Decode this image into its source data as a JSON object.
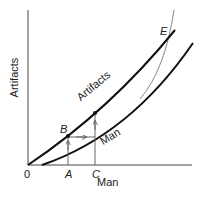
{
  "diagram": {
    "axes": {
      "x_label": "Man",
      "y_label": "Artifacts",
      "origin_label": "0"
    },
    "curves": [
      {
        "name": "Artifacts",
        "label": "Artifacts",
        "color": "#111111"
      },
      {
        "name": "Man",
        "label": "Man",
        "color": "#111111"
      },
      {
        "name": "steep-curve",
        "label": "",
        "color": "#888888"
      }
    ],
    "points": {
      "A": "A",
      "B": "B",
      "C": "C",
      "E": "E"
    }
  }
}
